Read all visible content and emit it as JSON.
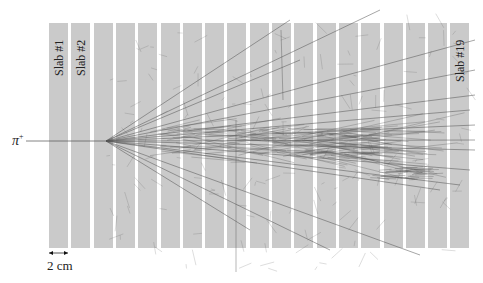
{
  "figure": {
    "beam": {
      "particle": "π",
      "charge": "+"
    },
    "slabs": {
      "count": 19,
      "labels": [
        {
          "index": 1,
          "text": "Slab #1"
        },
        {
          "index": 2,
          "text": "Slab #2"
        },
        {
          "index": 19,
          "text": "Slab #19"
        }
      ],
      "first_x": 49,
      "pitch": 22.3,
      "width": 19,
      "top": 23,
      "height": 225,
      "color": "#cacaca"
    },
    "scale_bar": {
      "label": "2 cm",
      "length_px": 19
    },
    "interaction_point": {
      "x": 106,
      "y": 141
    },
    "track_color": "#555555"
  }
}
